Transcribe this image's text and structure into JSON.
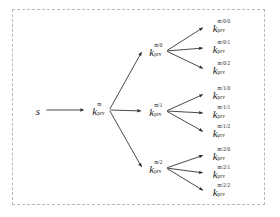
{
  "diagram": {
    "frame": {
      "style": "dashed",
      "color": "#b9b9b9"
    },
    "ink_color": "#1c1c1c",
    "background": "#ffffff",
    "root": {
      "label": "s",
      "kind": "seed"
    },
    "nodes": [
      {
        "id": "s",
        "base": "s",
        "sup": "",
        "sub": "",
        "x": 38,
        "y": 110
      },
      {
        "id": "m",
        "base": "k",
        "sup": "m",
        "sub": "prv",
        "x": 97,
        "y": 110
      },
      {
        "id": "m0",
        "base": "k",
        "sup": "m/0",
        "sub": "prv",
        "x": 154,
        "y": 51
      },
      {
        "id": "m1",
        "base": "k",
        "sup": "m/1",
        "sub": "prv",
        "x": 154,
        "y": 111
      },
      {
        "id": "m2",
        "base": "k",
        "sup": "m/2",
        "sub": "prv",
        "x": 154,
        "y": 168
      },
      {
        "id": "m00",
        "base": "k",
        "sup": "m/0/0",
        "sub": "prv",
        "x": 219,
        "y": 27
      },
      {
        "id": "m01",
        "base": "k",
        "sup": "m/0/1",
        "sub": "prv",
        "x": 219,
        "y": 48
      },
      {
        "id": "m02",
        "base": "k",
        "sup": "m/0/2",
        "sub": "prv",
        "x": 219,
        "y": 69
      },
      {
        "id": "m10",
        "base": "k",
        "sup": "m/1/0",
        "sub": "prv",
        "x": 219,
        "y": 94
      },
      {
        "id": "m11",
        "base": "k",
        "sup": "m/1/1",
        "sub": "prv",
        "x": 219,
        "y": 113
      },
      {
        "id": "m12",
        "base": "k",
        "sup": "m/1/2",
        "sub": "prv",
        "x": 219,
        "y": 132
      },
      {
        "id": "m20",
        "base": "k",
        "sup": "m/2/0",
        "sub": "prv",
        "x": 219,
        "y": 155
      },
      {
        "id": "m21",
        "base": "k",
        "sup": "m/2/1",
        "sub": "prv",
        "x": 219,
        "y": 173
      },
      {
        "id": "m22",
        "base": "k",
        "sup": "m/2/2",
        "sub": "prv",
        "x": 219,
        "y": 191
      }
    ],
    "edges": [
      {
        "from": "s",
        "to": "m"
      },
      {
        "from": "m",
        "to": "m0"
      },
      {
        "from": "m",
        "to": "m1"
      },
      {
        "from": "m",
        "to": "m2"
      },
      {
        "from": "m0",
        "to": "m00"
      },
      {
        "from": "m0",
        "to": "m01"
      },
      {
        "from": "m0",
        "to": "m02"
      },
      {
        "from": "m1",
        "to": "m10"
      },
      {
        "from": "m1",
        "to": "m11"
      },
      {
        "from": "m1",
        "to": "m12"
      },
      {
        "from": "m2",
        "to": "m20"
      },
      {
        "from": "m2",
        "to": "m21"
      },
      {
        "from": "m2",
        "to": "m22"
      }
    ],
    "node_labels": {
      "s": "s",
      "m": "k prv m",
      "m0": "k prv m/0",
      "m1": "k prv m/1",
      "m2": "k prv m/2",
      "m00": "k prv m/0/0",
      "m01": "k prv m/0/1",
      "m02": "k prv m/0/2",
      "m10": "k prv m/1/0",
      "m11": "k prv m/1/1",
      "m12": "k prv m/1/2",
      "m20": "k prv m/2/0",
      "m21": "k prv m/2/1",
      "m22": "k prv m/2/2"
    }
  }
}
